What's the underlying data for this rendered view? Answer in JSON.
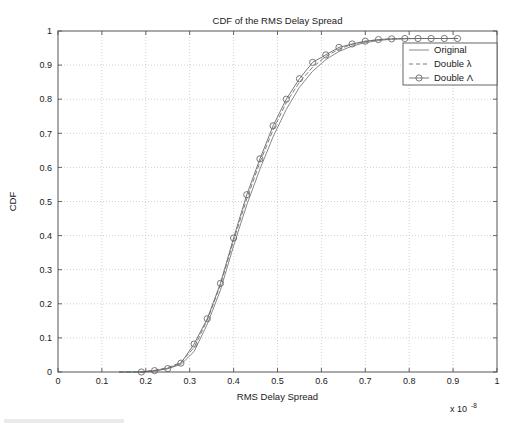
{
  "chart_data": {
    "type": "line",
    "title": "CDF of the RMS Delay Spread",
    "xlabel": "RMS Delay Spread",
    "ylabel": "CDF",
    "x_exponent_prefix": "x 10",
    "x_exponent_power": "-8",
    "xlim": [
      0,
      1
    ],
    "ylim": [
      0,
      1
    ],
    "xticks": [
      "0",
      "0.1",
      "0.2",
      "0.3",
      "0.4",
      "0.5",
      "0.6",
      "0.7",
      "0.8",
      "0.9",
      "1"
    ],
    "yticks": [
      "0",
      "0.1",
      "0.2",
      "0.3",
      "0.4",
      "0.5",
      "0.6",
      "0.7",
      "0.8",
      "0.9",
      "1"
    ],
    "xtick_values": [
      0,
      0.1,
      0.2,
      0.3,
      0.4,
      0.5,
      0.6,
      0.7,
      0.8,
      0.9,
      1
    ],
    "ytick_values": [
      0,
      0.1,
      0.2,
      0.3,
      0.4,
      0.5,
      0.6,
      0.7,
      0.8,
      0.9,
      1
    ],
    "grid": true,
    "grid_style": "dotted",
    "legend_position": "top-right",
    "colors": {
      "original": "#7a7a7a",
      "double_lambda_small": "#6e6e6e",
      "double_lambda_capital": "#6a6a6a",
      "axis": "#555555",
      "grid": "#bdbdbd",
      "background": "#ffffff"
    },
    "series": [
      {
        "name": "Original",
        "style": "solid",
        "marker": "none",
        "x": [
          0.14,
          0.19,
          0.22,
          0.25,
          0.28,
          0.31,
          0.34,
          0.37,
          0.4,
          0.43,
          0.46,
          0.49,
          0.52,
          0.55,
          0.58,
          0.61,
          0.64,
          0.67,
          0.7,
          0.73,
          0.76,
          0.79,
          0.82,
          0.85,
          0.88,
          0.91
        ],
        "y": [
          0.0,
          0.0,
          0.003,
          0.01,
          0.022,
          0.06,
          0.14,
          0.24,
          0.37,
          0.49,
          0.595,
          0.69,
          0.77,
          0.835,
          0.882,
          0.916,
          0.94,
          0.956,
          0.966,
          0.972,
          0.976,
          0.977,
          0.978,
          0.978,
          0.978,
          0.978
        ]
      },
      {
        "name": "Double λ",
        "style": "dashed",
        "marker": "none",
        "x": [
          0.14,
          0.19,
          0.22,
          0.25,
          0.28,
          0.31,
          0.34,
          0.37,
          0.4,
          0.43,
          0.46,
          0.49,
          0.52,
          0.55,
          0.58,
          0.61,
          0.64,
          0.67,
          0.7,
          0.73,
          0.76,
          0.79,
          0.82,
          0.85,
          0.88,
          0.91
        ],
        "y": [
          0.0,
          0.0,
          0.005,
          0.013,
          0.028,
          0.072,
          0.152,
          0.255,
          0.385,
          0.508,
          0.615,
          0.71,
          0.79,
          0.85,
          0.894,
          0.925,
          0.947,
          0.961,
          0.969,
          0.974,
          0.977,
          0.978,
          0.978,
          0.978,
          0.978,
          0.978
        ]
      },
      {
        "name": "Double Λ",
        "style": "solid",
        "marker": "circle",
        "x": [
          0.19,
          0.22,
          0.25,
          0.28,
          0.31,
          0.34,
          0.37,
          0.4,
          0.43,
          0.46,
          0.49,
          0.52,
          0.55,
          0.58,
          0.61,
          0.64,
          0.67,
          0.7,
          0.73,
          0.76,
          0.79,
          0.82,
          0.85,
          0.88,
          0.91
        ],
        "y": [
          0.0,
          0.004,
          0.01,
          0.026,
          0.082,
          0.156,
          0.26,
          0.393,
          0.52,
          0.625,
          0.722,
          0.8,
          0.86,
          0.908,
          0.93,
          0.952,
          0.962,
          0.97,
          0.975,
          0.977,
          0.978,
          0.978,
          0.978,
          0.978,
          0.978
        ]
      }
    ],
    "legend": [
      {
        "label": "Original",
        "style": "solid",
        "marker": "none"
      },
      {
        "label": "Double λ",
        "style": "dashed",
        "marker": "none"
      },
      {
        "label": "Double Λ",
        "style": "solid",
        "marker": "circle"
      }
    ]
  },
  "axes_geometry": {
    "left": 58,
    "right": 497,
    "top": 31,
    "bottom": 372
  },
  "legend_box": {
    "left": 403,
    "top": 43,
    "width": 94,
    "height": 42
  }
}
